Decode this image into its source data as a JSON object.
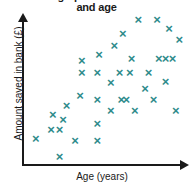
{
  "chart_data": {
    "type": "scatter",
    "title": "Scatter graph of amount saved\nand age",
    "title_visible": "and age",
    "title_note": "First line of the title is cropped off the top edge of the screenshot; only 'and age' is fully legible.",
    "xlabel": "Age (years)",
    "ylabel": "Amount saved in bank (£)",
    "grid": false,
    "legend": null,
    "tick_labels": {
      "x": [],
      "y": []
    },
    "xlim": [
      0,
      100
    ],
    "ylim": [
      0,
      100
    ],
    "marker": "x",
    "marker_color": "#2e8b8b",
    "axis_color": "#1a1a1a",
    "background_color": "#ffffff",
    "n_points": 38,
    "points": [
      {
        "x": 8,
        "y": 18
      },
      {
        "x": 22,
        "y": 6
      },
      {
        "x": 18,
        "y": 34
      },
      {
        "x": 17,
        "y": 24
      },
      {
        "x": 22,
        "y": 24
      },
      {
        "x": 24,
        "y": 31
      },
      {
        "x": 26,
        "y": 40
      },
      {
        "x": 31,
        "y": 17
      },
      {
        "x": 34,
        "y": 47
      },
      {
        "x": 35,
        "y": 62
      },
      {
        "x": 35,
        "y": 70
      },
      {
        "x": 44,
        "y": 17
      },
      {
        "x": 44,
        "y": 28
      },
      {
        "x": 44,
        "y": 44
      },
      {
        "x": 44,
        "y": 62
      },
      {
        "x": 45,
        "y": 74
      },
      {
        "x": 52,
        "y": 37
      },
      {
        "x": 52,
        "y": 55
      },
      {
        "x": 54,
        "y": 80
      },
      {
        "x": 57,
        "y": 62
      },
      {
        "x": 58,
        "y": 44
      },
      {
        "x": 59,
        "y": 88
      },
      {
        "x": 61,
        "y": 44
      },
      {
        "x": 63,
        "y": 62
      },
      {
        "x": 64,
        "y": 71
      },
      {
        "x": 66,
        "y": 37
      },
      {
        "x": 68,
        "y": 97
      },
      {
        "x": 72,
        "y": 51
      },
      {
        "x": 74,
        "y": 62
      },
      {
        "x": 77,
        "y": 44
      },
      {
        "x": 79,
        "y": 97
      },
      {
        "x": 80,
        "y": 71
      },
      {
        "x": 84,
        "y": 71
      },
      {
        "x": 84,
        "y": 56
      },
      {
        "x": 86,
        "y": 91
      },
      {
        "x": 88,
        "y": 71
      },
      {
        "x": 90,
        "y": 37
      },
      {
        "x": 92,
        "y": 84
      }
    ]
  }
}
